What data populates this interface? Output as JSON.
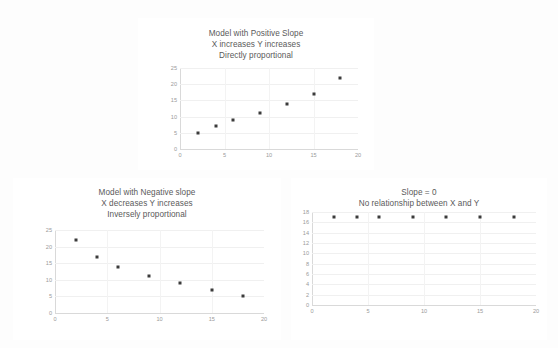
{
  "chart_data": [
    {
      "id": "positive",
      "type": "scatter",
      "title": "Model with Positive Slope",
      "subtitle": "X increases Y increases",
      "subtitle2": "Directly proportional",
      "xlabel": "",
      "ylabel": "",
      "xlim": [
        0,
        20
      ],
      "ylim": [
        0,
        25
      ],
      "xticks": [
        0,
        5,
        10,
        15,
        20
      ],
      "yticks": [
        0,
        5,
        10,
        15,
        20,
        25
      ],
      "grid": true,
      "legend": "none",
      "marker_color": "#3b3b3b",
      "x": [
        2,
        4,
        6,
        9,
        12,
        15,
        18
      ],
      "y": [
        5,
        7,
        9,
        11,
        14,
        17,
        22
      ]
    },
    {
      "id": "negative",
      "type": "scatter",
      "title": "Model with Negative slope",
      "subtitle": "X decreases Y increases",
      "subtitle2": "Inversely proportional",
      "xlabel": "",
      "ylabel": "",
      "xlim": [
        0,
        20
      ],
      "ylim": [
        0,
        25
      ],
      "xticks": [
        0,
        5,
        10,
        15,
        20
      ],
      "yticks": [
        0,
        5,
        10,
        15,
        20,
        25
      ],
      "grid": true,
      "legend": "none",
      "marker_color": "#3b3b3b",
      "x": [
        2,
        4,
        6,
        9,
        12,
        15,
        18
      ],
      "y": [
        22,
        17,
        14,
        11,
        9,
        7,
        5
      ]
    },
    {
      "id": "zero",
      "type": "scatter",
      "title": "Slope = 0",
      "subtitle": "No relationship between X and Y",
      "subtitle2": "",
      "xlabel": "",
      "ylabel": "",
      "xlim": [
        0,
        20
      ],
      "ylim": [
        0,
        18
      ],
      "xticks": [
        0,
        5,
        10,
        15,
        20
      ],
      "yticks": [
        0,
        2,
        4,
        6,
        8,
        10,
        12,
        14,
        16,
        18
      ],
      "grid": true,
      "legend": "none",
      "marker_color": "#3b3b3b",
      "x": [
        2,
        4,
        6,
        9,
        12,
        15,
        18
      ],
      "y": [
        17,
        17,
        17,
        17,
        17,
        17,
        17
      ]
    }
  ]
}
